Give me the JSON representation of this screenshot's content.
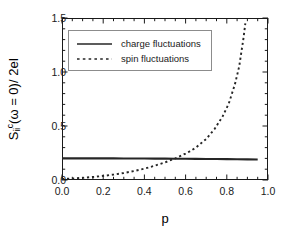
{
  "chart_data": {
    "type": "line",
    "title": "",
    "xlabel": "p",
    "ylabel": "S_ii^c(ω=0) / 2eI",
    "ylabel_parts": {
      "symbol": "S",
      "subscript": "ii",
      "superscript": "c",
      "argument": "(ω = 0)",
      "denominator": "/ 2eI"
    },
    "xlim": [
      0.0,
      1.0
    ],
    "ylim": [
      0.0,
      1.5
    ],
    "xticks": [
      "0.0",
      "0.2",
      "0.4",
      "0.6",
      "0.8",
      "1.0"
    ],
    "xtick_values": [
      0.0,
      0.2,
      0.4,
      0.6,
      0.8,
      1.0
    ],
    "yticks": [
      "0.0",
      "0.5",
      "1.0",
      "1.5"
    ],
    "ytick_values": [
      0.0,
      0.5,
      1.0,
      1.5
    ],
    "x_minor_step": 0.05,
    "y_minor_step": 0.1,
    "grid": false,
    "ticks_direction": "in",
    "frame": "box",
    "legend_position": "upper left",
    "line_color": "#262626",
    "frame_color": "#1a1a1a",
    "legend_border_color": "#8c8c8c",
    "series": [
      {
        "name": "charge fluctuations",
        "style": "solid",
        "color": "#262626",
        "x": [
          0.0,
          0.05,
          0.1,
          0.15,
          0.2,
          0.25,
          0.3,
          0.35,
          0.4,
          0.45,
          0.5,
          0.55,
          0.6,
          0.65,
          0.7,
          0.75,
          0.8,
          0.85,
          0.9,
          0.95
        ],
        "values": [
          0.2,
          0.2,
          0.2,
          0.2,
          0.2,
          0.2,
          0.199,
          0.199,
          0.199,
          0.198,
          0.198,
          0.197,
          0.197,
          0.196,
          0.195,
          0.194,
          0.193,
          0.192,
          0.191,
          0.19
        ]
      },
      {
        "name": "spin fluctuations",
        "style": "dotted",
        "color": "#262626",
        "x": [
          0.0,
          0.05,
          0.1,
          0.15,
          0.2,
          0.25,
          0.3,
          0.35,
          0.4,
          0.45,
          0.5,
          0.55,
          0.6,
          0.62,
          0.65,
          0.7,
          0.74,
          0.78,
          0.81,
          0.84,
          0.86,
          0.88,
          0.89
        ],
        "values": [
          0.01,
          0.014,
          0.02,
          0.028,
          0.038,
          0.05,
          0.065,
          0.083,
          0.105,
          0.132,
          0.163,
          0.2,
          0.245,
          0.265,
          0.3,
          0.38,
          0.47,
          0.59,
          0.71,
          0.89,
          1.05,
          1.3,
          1.45
        ]
      }
    ],
    "annotations": {
      "crossover_p": 0.62,
      "crossover_value": 0.197
    }
  },
  "legend": {
    "entries": [
      {
        "label": "charge fluctuations",
        "style": "solid"
      },
      {
        "label": "spin fluctuations",
        "style": "dotted"
      }
    ]
  }
}
